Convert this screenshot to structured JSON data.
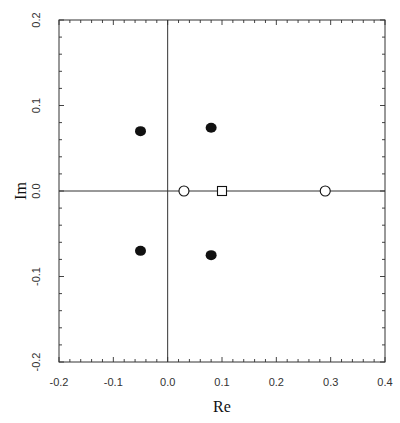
{
  "chart_data": {
    "type": "scatter",
    "title": "",
    "xlabel": "Re",
    "ylabel": "Im",
    "xlim": [
      -0.2,
      0.4
    ],
    "ylim": [
      -0.2,
      0.2
    ],
    "grid": false,
    "legend": null,
    "reference_lines": [
      {
        "orientation": "horizontal",
        "value": 0.0
      },
      {
        "orientation": "vertical",
        "value": 0.0
      }
    ],
    "x_ticks": {
      "major": [
        -0.2,
        -0.1,
        0.0,
        0.1,
        0.2,
        0.3,
        0.4
      ],
      "labels": [
        "-0.2",
        "-0.1",
        "0.0",
        "0.1",
        "0.2",
        "0.3",
        "0.4"
      ],
      "minor_step": 0.02
    },
    "y_ticks": {
      "major": [
        -0.2,
        -0.1,
        0.0,
        0.1,
        0.2
      ],
      "labels": [
        "-0.2",
        "-0.1",
        "0.0",
        "0.1",
        "0.2"
      ],
      "minor_step": 0.02
    },
    "series": [
      {
        "name": "filled circles",
        "marker": "filled-circle",
        "color": "#111111",
        "points": [
          {
            "x": -0.05,
            "y": 0.07
          },
          {
            "x": 0.08,
            "y": 0.074
          },
          {
            "x": -0.05,
            "y": -0.07
          },
          {
            "x": 0.08,
            "y": -0.075
          }
        ]
      },
      {
        "name": "open circles",
        "marker": "open-circle",
        "color": "#111111",
        "points": [
          {
            "x": 0.03,
            "y": 0.0
          },
          {
            "x": 0.29,
            "y": 0.0
          }
        ]
      },
      {
        "name": "open square",
        "marker": "open-square",
        "color": "#111111",
        "points": [
          {
            "x": 0.1,
            "y": 0.0
          }
        ]
      }
    ]
  },
  "layout": {
    "plot_left": 59,
    "plot_top": 20,
    "plot_right": 385,
    "plot_bottom": 362
  }
}
